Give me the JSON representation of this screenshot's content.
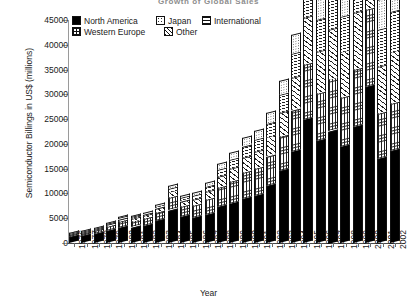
{
  "chart": {
    "title": "Growth of Global Sales",
    "xlabel": "Year",
    "ylabel": "Semiconductor Billings in US$ (millions)"
  },
  "legend": {
    "row1": [
      {
        "label": "North America",
        "pattern": "solid"
      },
      {
        "label": "Japan",
        "pattern": "dots"
      },
      {
        "label": "International",
        "pattern": "horiz"
      }
    ],
    "row2": [
      {
        "label": "Western Europe",
        "pattern": "grid"
      },
      {
        "label": "Other",
        "pattern": "diag"
      }
    ]
  },
  "yaxis": {
    "ticks": [
      "45000",
      "40000",
      "35000",
      "30000",
      "25000",
      "20000",
      "15000",
      "10000",
      "5000",
      "0"
    ],
    "min": 0,
    "max": 45000,
    "step": 5000
  },
  "chart_data": {
    "type": "bar",
    "stacked": true,
    "title": "Growth of Global Sales",
    "xlabel": "Year",
    "ylabel": "Semiconductor Billings in US$ (millions)",
    "ylim": [
      0,
      45000
    ],
    "ytick_step": 5000,
    "grid": false,
    "legend_position": "top-left",
    "categories": [
      "1976",
      "1977",
      "1978",
      "1979",
      "1980",
      "1981",
      "1982",
      "1983",
      "1984",
      "1985",
      "1986",
      "1987",
      "1988",
      "1989",
      "1990",
      "1991",
      "1992",
      "1993",
      "1994",
      "1995",
      "1996",
      "1997",
      "1998",
      "1999",
      "2000",
      "2001",
      "2002"
    ],
    "series": [
      {
        "name": "North America",
        "pattern": "solid",
        "values": [
          1200,
          1400,
          1800,
          2400,
          3000,
          3100,
          3400,
          4400,
          6500,
          5200,
          5000,
          5600,
          7200,
          8000,
          8900,
          9500,
          11500,
          14500,
          18500,
          25000,
          20500,
          22500,
          19500,
          23500,
          31500,
          17000,
          18500
        ]
      },
      {
        "name": "Western Europe",
        "pattern": "grid",
        "values": [
          400,
          500,
          650,
          900,
          1150,
          1250,
          1350,
          1700,
          2500,
          2100,
          2400,
          3000,
          3900,
          4400,
          5200,
          5400,
          5900,
          6800,
          8200,
          11000,
          9500,
          10500,
          9800,
          11500,
          15500,
          9000,
          9500
        ]
      },
      {
        "name": "Other",
        "pattern": "diag",
        "values": [
          150,
          200,
          260,
          380,
          500,
          560,
          620,
          800,
          1200,
          1050,
          1250,
          1650,
          2200,
          2600,
          3100,
          3400,
          3900,
          4900,
          6500,
          9500,
          8500,
          10000,
          9200,
          11500,
          16500,
          9500,
          10500
        ]
      },
      {
        "name": "International",
        "pattern": "horiz",
        "values": [
          90,
          120,
          160,
          230,
          300,
          340,
          380,
          500,
          760,
          680,
          830,
          1100,
          1500,
          1800,
          2200,
          2400,
          2800,
          3600,
          4900,
          7200,
          6500,
          7800,
          7200,
          9000,
          13000,
          7500,
          8200
        ]
      },
      {
        "name": "Japan",
        "pattern": "dots",
        "values": [
          60,
          80,
          110,
          160,
          210,
          240,
          270,
          360,
          540,
          470,
          620,
          850,
          1200,
          1400,
          1700,
          1900,
          2200,
          2900,
          3900,
          5800,
          5200,
          6200,
          5800,
          7200,
          10500,
          6000,
          6600
        ]
      }
    ],
    "totals": [
      1900,
      2300,
      2980,
      4070,
      5160,
      5490,
      6020,
      7760,
      11500,
      9500,
      10100,
      12200,
      16000,
      18200,
      21100,
      22600,
      26300,
      32700,
      42000,
      58500,
      50200,
      57000,
      51500,
      62700,
      87000,
      49000,
      53300
    ]
  }
}
